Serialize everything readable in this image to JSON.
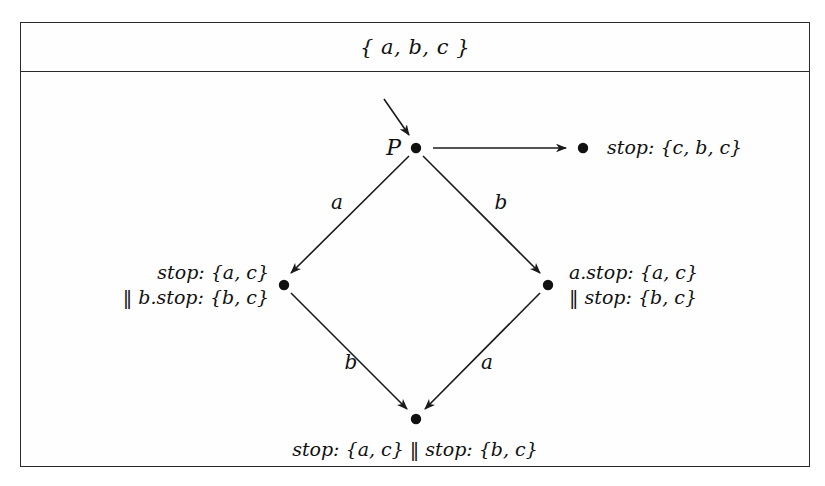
{
  "figure": {
    "header": {
      "alphabet": "{ a, b, c }"
    },
    "process_label": "P",
    "nodes": [
      {
        "id": "top",
        "name": "initial-state-node",
        "label": "P"
      },
      {
        "id": "right_top",
        "name": "stop-state-node",
        "label": "stop: {c, b, c}"
      },
      {
        "id": "left",
        "name": "left-state-node",
        "label_line1": "stop: {a, c}",
        "label_line2": "‖ b.stop: {b, c}"
      },
      {
        "id": "right",
        "name": "right-state-node",
        "label_line1": "a.stop: {a, c}",
        "label_line2": "‖ stop: {b, c}"
      },
      {
        "id": "bottom",
        "name": "bottom-state-node",
        "label": "stop: {a, c} ‖ stop: {b, c}"
      }
    ],
    "edges": [
      {
        "name": "edge-top-to-left",
        "label": "a"
      },
      {
        "name": "edge-top-to-right",
        "label": "b"
      },
      {
        "name": "edge-left-to-bottom",
        "label": "b"
      },
      {
        "name": "edge-right-to-bottom",
        "label": "a"
      },
      {
        "name": "edge-top-to-stop",
        "label": ""
      },
      {
        "name": "edge-entry-arrow",
        "label": ""
      }
    ],
    "colors": {
      "ink": "#111111",
      "frame": "#2a2a2a",
      "background": "#ffffff"
    }
  }
}
